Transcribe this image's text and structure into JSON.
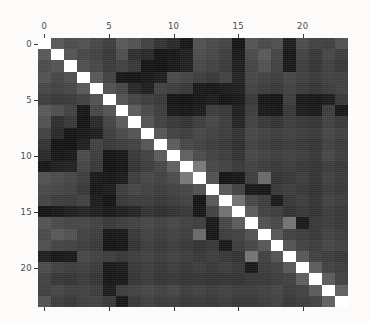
{
  "chart_data": {
    "type": "heatmap",
    "title": "",
    "subtitle": "",
    "xlabel": "",
    "ylabel": "",
    "grid": false,
    "legend": "none",
    "colormap": "gray",
    "value_range": [
      0.0,
      1.0
    ],
    "n_rows": 24,
    "n_cols": 24,
    "x_axis": {
      "position": "top",
      "tick_values": [
        0,
        5,
        10,
        15,
        20
      ],
      "tick_labels": [
        "0",
        "5",
        "10",
        "15",
        "20"
      ],
      "range": [
        -0.5,
        23.5
      ],
      "bottom_ticks_unlabeled": true
    },
    "y_axis": {
      "position": "left",
      "tick_values": [
        0,
        5,
        10,
        15,
        20
      ],
      "tick_labels": [
        "0",
        "5",
        "10",
        "15",
        "20"
      ],
      "range": [
        23.5,
        -0.5
      ],
      "inverted": true
    },
    "row_labels": [
      "0",
      "1",
      "2",
      "3",
      "4",
      "5",
      "6",
      "7",
      "8",
      "9",
      "10",
      "11",
      "12",
      "13",
      "14",
      "15",
      "16",
      "17",
      "18",
      "19",
      "20",
      "21",
      "22",
      "23"
    ],
    "col_labels": [
      "0",
      "1",
      "2",
      "3",
      "4",
      "5",
      "6",
      "7",
      "8",
      "9",
      "10",
      "11",
      "12",
      "13",
      "14",
      "15",
      "16",
      "17",
      "18",
      "19",
      "20",
      "21",
      "22",
      "23"
    ],
    "values": [
      [
        1.0,
        0.33,
        0.28,
        0.3,
        0.26,
        0.22,
        0.33,
        0.3,
        0.24,
        0.18,
        0.14,
        0.07,
        0.3,
        0.27,
        0.25,
        0.06,
        0.31,
        0.27,
        0.29,
        0.1,
        0.28,
        0.24,
        0.23,
        0.3
      ],
      [
        0.33,
        1.0,
        0.31,
        0.26,
        0.24,
        0.2,
        0.29,
        0.16,
        0.14,
        0.06,
        0.07,
        0.1,
        0.28,
        0.26,
        0.22,
        0.08,
        0.27,
        0.33,
        0.25,
        0.07,
        0.24,
        0.2,
        0.26,
        0.22
      ],
      [
        0.28,
        0.31,
        1.0,
        0.29,
        0.26,
        0.21,
        0.24,
        0.2,
        0.06,
        0.05,
        0.08,
        0.11,
        0.26,
        0.24,
        0.21,
        0.1,
        0.25,
        0.3,
        0.24,
        0.08,
        0.22,
        0.19,
        0.23,
        0.2
      ],
      [
        0.3,
        0.26,
        0.29,
        1.0,
        0.33,
        0.24,
        0.07,
        0.06,
        0.08,
        0.1,
        0.27,
        0.25,
        0.22,
        0.2,
        0.24,
        0.12,
        0.26,
        0.24,
        0.22,
        0.26,
        0.23,
        0.21,
        0.24,
        0.23
      ],
      [
        0.26,
        0.24,
        0.26,
        0.33,
        1.0,
        0.3,
        0.26,
        0.14,
        0.1,
        0.24,
        0.22,
        0.2,
        0.08,
        0.07,
        0.09,
        0.1,
        0.24,
        0.22,
        0.2,
        0.24,
        0.21,
        0.19,
        0.22,
        0.24
      ],
      [
        0.22,
        0.2,
        0.21,
        0.24,
        0.3,
        1.0,
        0.31,
        0.25,
        0.22,
        0.2,
        0.06,
        0.05,
        0.07,
        0.09,
        0.06,
        0.08,
        0.2,
        0.07,
        0.06,
        0.22,
        0.08,
        0.07,
        0.09,
        0.2
      ],
      [
        0.33,
        0.29,
        0.24,
        0.07,
        0.26,
        0.31,
        1.0,
        0.34,
        0.27,
        0.22,
        0.08,
        0.07,
        0.09,
        0.22,
        0.2,
        0.1,
        0.22,
        0.08,
        0.07,
        0.2,
        0.09,
        0.08,
        0.22,
        0.07
      ],
      [
        0.3,
        0.16,
        0.2,
        0.06,
        0.14,
        0.25,
        0.34,
        1.0,
        0.31,
        0.24,
        0.2,
        0.18,
        0.22,
        0.26,
        0.22,
        0.12,
        0.24,
        0.2,
        0.18,
        0.22,
        0.2,
        0.19,
        0.24,
        0.2
      ],
      [
        0.24,
        0.14,
        0.06,
        0.08,
        0.1,
        0.22,
        0.27,
        0.31,
        1.0,
        0.32,
        0.24,
        0.22,
        0.26,
        0.24,
        0.22,
        0.18,
        0.26,
        0.24,
        0.22,
        0.24,
        0.22,
        0.21,
        0.26,
        0.23
      ],
      [
        0.18,
        0.06,
        0.05,
        0.1,
        0.24,
        0.2,
        0.22,
        0.24,
        0.32,
        1.0,
        0.34,
        0.26,
        0.24,
        0.22,
        0.2,
        0.16,
        0.24,
        0.22,
        0.2,
        0.22,
        0.2,
        0.19,
        0.24,
        0.21
      ],
      [
        0.14,
        0.07,
        0.08,
        0.27,
        0.22,
        0.06,
        0.08,
        0.2,
        0.24,
        0.34,
        1.0,
        0.36,
        0.28,
        0.24,
        0.22,
        0.18,
        0.26,
        0.24,
        0.22,
        0.24,
        0.22,
        0.2,
        0.26,
        0.22
      ],
      [
        0.07,
        0.1,
        0.11,
        0.25,
        0.2,
        0.05,
        0.07,
        0.18,
        0.22,
        0.26,
        0.36,
        1.0,
        0.46,
        0.26,
        0.24,
        0.2,
        0.24,
        0.22,
        0.2,
        0.22,
        0.2,
        0.19,
        0.22,
        0.2
      ],
      [
        0.3,
        0.28,
        0.26,
        0.22,
        0.08,
        0.07,
        0.09,
        0.22,
        0.26,
        0.24,
        0.28,
        0.46,
        1.0,
        0.3,
        0.06,
        0.07,
        0.22,
        0.4,
        0.18,
        0.2,
        0.22,
        0.19,
        0.24,
        0.21
      ],
      [
        0.27,
        0.26,
        0.24,
        0.2,
        0.07,
        0.09,
        0.22,
        0.26,
        0.24,
        0.22,
        0.24,
        0.26,
        0.3,
        1.0,
        0.33,
        0.24,
        0.08,
        0.07,
        0.2,
        0.22,
        0.2,
        0.18,
        0.22,
        0.2
      ],
      [
        0.25,
        0.22,
        0.21,
        0.24,
        0.09,
        0.06,
        0.2,
        0.22,
        0.22,
        0.2,
        0.22,
        0.24,
        0.06,
        0.33,
        1.0,
        0.43,
        0.26,
        0.22,
        0.08,
        0.2,
        0.22,
        0.19,
        0.24,
        0.22
      ],
      [
        0.06,
        0.08,
        0.1,
        0.12,
        0.1,
        0.08,
        0.1,
        0.12,
        0.18,
        0.16,
        0.18,
        0.2,
        0.07,
        0.24,
        0.43,
        1.0,
        0.34,
        0.24,
        0.22,
        0.18,
        0.2,
        0.18,
        0.22,
        0.2
      ],
      [
        0.31,
        0.27,
        0.25,
        0.26,
        0.24,
        0.2,
        0.22,
        0.24,
        0.26,
        0.24,
        0.26,
        0.24,
        0.22,
        0.08,
        0.26,
        0.34,
        1.0,
        0.3,
        0.26,
        0.44,
        0.08,
        0.2,
        0.22,
        0.2
      ],
      [
        0.27,
        0.33,
        0.3,
        0.24,
        0.22,
        0.07,
        0.08,
        0.2,
        0.24,
        0.22,
        0.24,
        0.22,
        0.4,
        0.07,
        0.22,
        0.24,
        0.3,
        1.0,
        0.32,
        0.24,
        0.22,
        0.2,
        0.24,
        0.22
      ],
      [
        0.29,
        0.25,
        0.24,
        0.22,
        0.2,
        0.06,
        0.07,
        0.18,
        0.22,
        0.2,
        0.22,
        0.2,
        0.18,
        0.2,
        0.08,
        0.22,
        0.26,
        0.32,
        1.0,
        0.31,
        0.24,
        0.22,
        0.26,
        0.24
      ],
      [
        0.1,
        0.07,
        0.08,
        0.26,
        0.24,
        0.22,
        0.2,
        0.22,
        0.24,
        0.22,
        0.24,
        0.22,
        0.2,
        0.22,
        0.2,
        0.18,
        0.44,
        0.24,
        0.31,
        1.0,
        0.33,
        0.24,
        0.22,
        0.2
      ],
      [
        0.28,
        0.24,
        0.22,
        0.23,
        0.21,
        0.08,
        0.09,
        0.2,
        0.22,
        0.2,
        0.22,
        0.2,
        0.22,
        0.2,
        0.22,
        0.2,
        0.08,
        0.22,
        0.24,
        0.33,
        1.0,
        0.35,
        0.24,
        0.22
      ],
      [
        0.24,
        0.2,
        0.19,
        0.21,
        0.19,
        0.07,
        0.08,
        0.19,
        0.21,
        0.19,
        0.2,
        0.19,
        0.19,
        0.18,
        0.19,
        0.18,
        0.2,
        0.2,
        0.22,
        0.24,
        0.35,
        1.0,
        0.34,
        0.24
      ],
      [
        0.23,
        0.26,
        0.23,
        0.24,
        0.22,
        0.09,
        0.22,
        0.24,
        0.26,
        0.24,
        0.26,
        0.22,
        0.24,
        0.22,
        0.24,
        0.22,
        0.22,
        0.24,
        0.26,
        0.22,
        0.24,
        0.34,
        1.0,
        0.36
      ],
      [
        0.3,
        0.22,
        0.2,
        0.23,
        0.24,
        0.2,
        0.07,
        0.2,
        0.23,
        0.21,
        0.22,
        0.2,
        0.21,
        0.2,
        0.22,
        0.2,
        0.2,
        0.22,
        0.24,
        0.2,
        0.22,
        0.24,
        0.36,
        1.0
      ]
    ]
  }
}
